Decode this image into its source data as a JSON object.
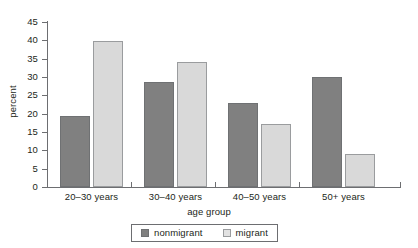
{
  "chart_data": {
    "type": "bar",
    "title": "",
    "subtitle": "",
    "xlabel": "age group",
    "ylabel": "percent",
    "categories": [
      "20–30 years",
      "30–40 years",
      "40–50 years",
      "50+ years"
    ],
    "series": [
      {
        "name": "nonmigrant",
        "color": "#808080",
        "values": [
          19.4,
          28.7,
          23.0,
          30.0
        ]
      },
      {
        "name": "migrant",
        "color": "#d9d9d9",
        "values": [
          39.8,
          34.0,
          17.3,
          9.0
        ]
      }
    ],
    "ylim": [
      0,
      45
    ],
    "ytick_values": [
      0,
      5,
      10,
      15,
      20,
      25,
      30,
      35,
      40,
      45
    ],
    "ytick_labels": [
      "0",
      "5",
      "10",
      "15",
      "20",
      "25",
      "30",
      "35",
      "40",
      "45"
    ],
    "grid": false,
    "legend_position": "bottom",
    "legend_entries": [
      "nonmigrant",
      "migrant"
    ],
    "annotations": []
  },
  "axis": {
    "y_title": "percent",
    "x_title": "age group"
  },
  "colors": {
    "nonmigrant": "#808080",
    "migrant": "#d9d9d9",
    "axis": "#6d6e71",
    "text": "#231f20",
    "background": "#ffffff"
  }
}
